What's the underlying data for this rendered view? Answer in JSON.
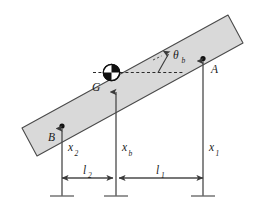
{
  "figure": {
    "type": "mechanics-free-body-diagram",
    "background_color": "#ffffff",
    "stroke_color": "#3a3a3a",
    "text_color": "#1a1a1a"
  },
  "beam": {
    "name": "rigid-beam",
    "fill_color": "#d9d9d9",
    "stroke_color": "#4a4a4a",
    "tilt_degrees": 17
  },
  "center_of_gravity": {
    "symbol": "quartered-circle",
    "label": "G",
    "label_sub": ""
  },
  "angle": {
    "label": "θ",
    "label_sub": "b",
    "reference": "horizontal-dashed-line"
  },
  "support_points": [
    {
      "id": "A",
      "label": "A",
      "side": "right"
    },
    {
      "id": "B",
      "label": "B",
      "side": "left"
    }
  ],
  "vertical_coordinates": [
    {
      "label": "x",
      "label_sub": "2",
      "position": "left"
    },
    {
      "label": "x",
      "label_sub": "b",
      "position": "center"
    },
    {
      "label": "x",
      "label_sub": "1",
      "position": "right"
    }
  ],
  "horizontal_dimensions": [
    {
      "label": "l",
      "label_sub": "2",
      "span": "left-to-center"
    },
    {
      "label": "l",
      "label_sub": "1",
      "span": "center-to-right"
    }
  ],
  "ground_supports": {
    "count": 3,
    "style": "short-horizontal-tick"
  }
}
